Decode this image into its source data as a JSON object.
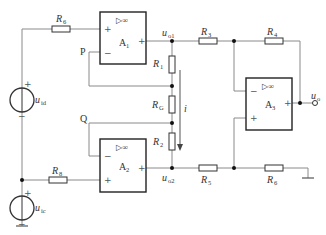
{
  "diagram": {
    "type": "instrumentation amplifier circuit (three op-amp)",
    "opamps": [
      {
        "id": "A1",
        "label": "A",
        "sub": "1",
        "symbol": "▷∞",
        "plus": "+",
        "minus": "−",
        "out_sign": "+"
      },
      {
        "id": "A2",
        "label": "A",
        "sub": "2",
        "symbol": "▷∞",
        "plus": "+",
        "minus": "−",
        "out_sign": "+"
      },
      {
        "id": "A3",
        "label": "A",
        "sub": "3",
        "symbol": "▷∞",
        "plus": "+",
        "minus": "−",
        "out_sign": "+"
      }
    ],
    "resistors": [
      {
        "id": "R1",
        "label": "R",
        "sub": "1"
      },
      {
        "id": "RG",
        "label": "R",
        "sub": "G"
      },
      {
        "id": "R2",
        "label": "R",
        "sub": "2"
      },
      {
        "id": "R3",
        "label": "R",
        "sub": "3"
      },
      {
        "id": "R4",
        "label": "R",
        "sub": "4"
      },
      {
        "id": "R5",
        "label": "R",
        "sub": "5"
      },
      {
        "id": "R6",
        "label": "R",
        "sub": "6"
      },
      {
        "id": "R7",
        "label": "R",
        "sub": "7"
      },
      {
        "id": "R8",
        "label": "R",
        "sub": "8"
      }
    ],
    "sources": [
      {
        "id": "uid",
        "label": "u",
        "sub": "id",
        "plus": "+",
        "minus": "−"
      },
      {
        "id": "uic",
        "label": "u",
        "sub": "ic",
        "plus": "+",
        "minus": "−"
      }
    ],
    "nodes": {
      "P": "P",
      "Q": "Q",
      "uo1": {
        "label": "u",
        "sub": "o1"
      },
      "uo2": {
        "label": "u",
        "sub": "o2"
      },
      "uo": {
        "label": "u",
        "sub": "o"
      }
    },
    "current": {
      "label": "i",
      "direction": "down"
    }
  }
}
